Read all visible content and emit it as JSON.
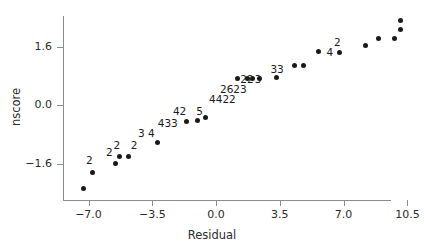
{
  "chart_data": {
    "type": "scatter",
    "title": "",
    "xlabel": "Residual",
    "ylabel": "nscore",
    "xlim": [
      -8.4,
      9.6
    ],
    "ylim": [
      -2.6,
      2.45
    ],
    "grid": false,
    "legend": null,
    "xticks": [
      {
        "value": -7.0,
        "label": "−7.0"
      },
      {
        "value": -3.5,
        "label": "−3.5"
      },
      {
        "value": 0.0,
        "label": "0.0"
      },
      {
        "value": 3.5,
        "label": "3.5"
      },
      {
        "value": 7.0,
        "label": "7.0"
      },
      {
        "value": 10.5,
        "label": "10.5"
      }
    ],
    "yticks": [
      {
        "value": 1.6,
        "label": "1.6"
      },
      {
        "value": 0.0,
        "label": "0.0"
      },
      {
        "value": -1.6,
        "label": "−1.6"
      }
    ],
    "points": [
      {
        "x": -7.3,
        "y": -2.28
      },
      {
        "x": -6.8,
        "y": -1.85
      },
      {
        "x": -5.5,
        "y": -1.61
      },
      {
        "x": -5.3,
        "y": -1.4
      },
      {
        "x": -4.8,
        "y": -1.4
      },
      {
        "x": -3.2,
        "y": -1.03
      },
      {
        "x": -1.6,
        "y": -0.44
      },
      {
        "x": -1.0,
        "y": -0.42
      },
      {
        "x": -0.6,
        "y": -0.33
      },
      {
        "x": 1.2,
        "y": 0.73
      },
      {
        "x": 1.7,
        "y": 0.73
      },
      {
        "x": 2.0,
        "y": 0.73
      },
      {
        "x": 2.4,
        "y": 0.73
      },
      {
        "x": 3.3,
        "y": 0.75
      },
      {
        "x": 4.3,
        "y": 1.1
      },
      {
        "x": 4.8,
        "y": 1.1
      },
      {
        "x": 5.6,
        "y": 1.47
      },
      {
        "x": 6.8,
        "y": 1.45
      },
      {
        "x": 8.2,
        "y": 1.63
      },
      {
        "x": 8.9,
        "y": 1.84
      },
      {
        "x": 9.8,
        "y": 1.83
      },
      {
        "x": 10.1,
        "y": 2.07
      },
      {
        "x": 10.1,
        "y": 2.33
      }
    ],
    "point_labels": [
      {
        "text": "2",
        "x": -6.95,
        "y": -1.51
      },
      {
        "text": "2",
        "x": -5.85,
        "y": -1.28
      },
      {
        "text": "2",
        "x": -5.45,
        "y": -1.1
      },
      {
        "text": "2",
        "x": -4.5,
        "y": -1.1
      },
      {
        "text": "3",
        "x": -4.1,
        "y": -0.76
      },
      {
        "text": "4",
        "x": -3.55,
        "y": -0.76
      },
      {
        "text": "433",
        "x": -2.65,
        "y": -0.5
      },
      {
        "text": "42",
        "x": -2.0,
        "y": -0.17
      },
      {
        "text": "5",
        "x": -0.9,
        "y": -0.17
      },
      {
        "text": "4422",
        "x": 0.35,
        "y": 0.17
      },
      {
        "text": "2623",
        "x": 0.95,
        "y": 0.45
      },
      {
        "text": "22",
        "x": 1.7,
        "y": 0.73
      },
      {
        "text": "3",
        "x": 2.3,
        "y": 0.73
      },
      {
        "text": "33",
        "x": 3.35,
        "y": 1.0
      },
      {
        "text": "2",
        "x": 6.65,
        "y": 1.75
      },
      {
        "text": "4",
        "x": 6.25,
        "y": 1.45
      }
    ]
  }
}
